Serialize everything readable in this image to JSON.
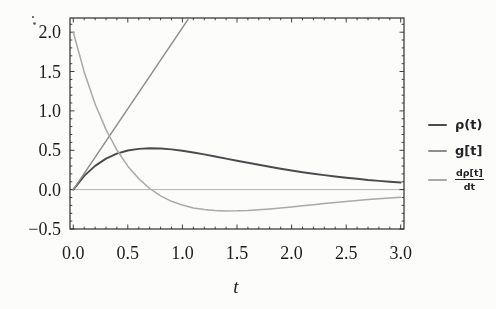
{
  "figure": {
    "legend": {
      "entries": [
        {
          "label": "ρ(t)"
        },
        {
          "label": "g[t]"
        },
        {
          "numerator": "dρ[t]",
          "denominator": "dt"
        }
      ]
    }
  },
  "chart_data": {
    "type": "line",
    "title": "",
    "xlabel": "t",
    "ylabel": "",
    "xlim": [
      -0.03,
      3.03
    ],
    "ylim": [
      -0.5,
      2.18
    ],
    "x_major_ticks": [
      0,
      0.5,
      1,
      1.5,
      2,
      2.5,
      3
    ],
    "x_tick_labels": [
      "0.0",
      "0.5",
      "1.0",
      "1.5",
      "2.0",
      "2.5",
      "3.0"
    ],
    "y_major_ticks": [
      -0.5,
      0,
      0.5,
      1,
      1.5,
      2
    ],
    "y_tick_labels": [
      "−0.5",
      "0.0",
      "0.5",
      "1.0",
      "1.5",
      "2.0"
    ],
    "minor_tick_step": 0.1,
    "grid": false,
    "zero_line": true,
    "legend_position": "right-outside",
    "frame": true,
    "frame_color": "#2e2e2e",
    "text_color": "#1c1c1c",
    "zero_line_color": "#b3b3b3",
    "background": "#fcfcfb",
    "series": [
      {
        "name": "rho",
        "label": "ρ(t)",
        "color": "#4b4b4f",
        "width": 1.9,
        "points": [
          [
            0,
            0
          ],
          [
            0.1,
            0.174
          ],
          [
            0.2,
            0.302
          ],
          [
            0.3,
            0.394
          ],
          [
            0.4,
            0.457
          ],
          [
            0.5,
            0.497
          ],
          [
            0.6,
            0.518
          ],
          [
            0.7,
            0.525
          ],
          [
            0.8,
            0.522
          ],
          [
            0.9,
            0.511
          ],
          [
            1,
            0.493
          ],
          [
            1.1,
            0.472
          ],
          [
            1.2,
            0.447
          ],
          [
            1.3,
            0.421
          ],
          [
            1.4,
            0.394
          ],
          [
            1.5,
            0.367
          ],
          [
            1.6,
            0.341
          ],
          [
            1.7,
            0.315
          ],
          [
            1.8,
            0.29
          ],
          [
            1.9,
            0.266
          ],
          [
            2,
            0.243
          ],
          [
            2.1,
            0.222
          ],
          [
            2.2,
            0.202
          ],
          [
            2.3,
            0.184
          ],
          [
            2.4,
            0.167
          ],
          [
            2.5,
            0.151
          ],
          [
            2.6,
            0.137
          ],
          [
            2.7,
            0.123
          ],
          [
            2.8,
            0.111
          ],
          [
            2.9,
            0.1
          ],
          [
            3,
            0.09
          ]
        ]
      },
      {
        "name": "g",
        "label": "g[t]",
        "color": "#8e8e8e",
        "width": 1.5,
        "points": [
          [
            0,
            0
          ],
          [
            1.05,
            2.16
          ]
        ]
      },
      {
        "name": "drho-dt",
        "label": "dρ[t]/dt",
        "color": "#a9a9a9",
        "width": 1.5,
        "points": [
          [
            0,
            2.0
          ],
          [
            0.1,
            1.495
          ],
          [
            0.2,
            1.088
          ],
          [
            0.3,
            0.762
          ],
          [
            0.4,
            0.503
          ],
          [
            0.5,
            0.298
          ],
          [
            0.6,
            0.138
          ],
          [
            0.7,
            0.015
          ],
          [
            0.8,
            -0.078
          ],
          [
            0.9,
            -0.148
          ],
          [
            1,
            -0.197
          ],
          [
            1.1,
            -0.232
          ],
          [
            1.2,
            -0.254
          ],
          [
            1.3,
            -0.266
          ],
          [
            1.4,
            -0.27
          ],
          [
            1.5,
            -0.269
          ],
          [
            1.6,
            -0.264
          ],
          [
            1.7,
            -0.255
          ],
          [
            1.8,
            -0.245
          ],
          [
            1.9,
            -0.232
          ],
          [
            2,
            -0.219
          ],
          [
            2.1,
            -0.205
          ],
          [
            2.2,
            -0.191
          ],
          [
            2.3,
            -0.177
          ],
          [
            2.4,
            -0.164
          ],
          [
            2.5,
            -0.151
          ],
          [
            2.6,
            -0.139
          ],
          [
            2.7,
            -0.127
          ],
          [
            2.8,
            -0.116
          ],
          [
            2.9,
            -0.106
          ],
          [
            3,
            -0.096
          ]
        ]
      }
    ]
  }
}
